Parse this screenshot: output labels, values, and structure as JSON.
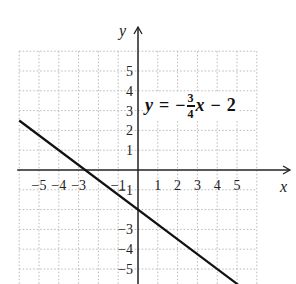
{
  "chart_data": {
    "type": "line",
    "title": "",
    "equation": {
      "lhs": "y",
      "equals": "=",
      "sign": "−",
      "numerator": "3",
      "denominator": "4",
      "variable": "x",
      "op": "−",
      "constant": "2",
      "text": "y = −(3/4)x − 2"
    },
    "xlabel": "x",
    "ylabel": "y",
    "xlim": [
      -6,
      7.5
    ],
    "ylim": [
      -5.8,
      7.2
    ],
    "grid": true,
    "grid_style": "dotted",
    "x_ticks": [
      -5,
      -4,
      -3,
      -1,
      1,
      2,
      3,
      4,
      5
    ],
    "x_tick_labels": [
      "−5",
      "−4",
      "−3",
      "−1",
      "1",
      "2",
      "3",
      "4",
      "5"
    ],
    "y_ticks": [
      5,
      4,
      3,
      2,
      1,
      -1,
      -3,
      -4,
      -5
    ],
    "y_tick_labels": [
      "5",
      "4",
      "3",
      "2",
      "1",
      "−1",
      "−3",
      "−4",
      "−5"
    ],
    "series": [
      {
        "name": "y = -3/4 x - 2",
        "slope": -0.75,
        "intercept": -2,
        "x": [
          -6,
          -4,
          0,
          4,
          5
        ],
        "y": [
          2.5,
          1,
          -2,
          -5,
          -5.75
        ]
      }
    ],
    "colors": {
      "line": "#111111",
      "axes": "#222222",
      "grid": "#b8b8b8"
    }
  }
}
